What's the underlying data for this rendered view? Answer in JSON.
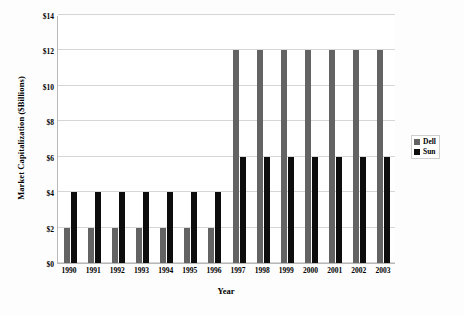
{
  "chart_data": {
    "type": "bar",
    "title": "",
    "xlabel": "Year",
    "ylabel": "Market Capitalization ($Billions)",
    "categories": [
      "1990",
      "1991",
      "1992",
      "1993",
      "1994",
      "1995",
      "1996",
      "1997",
      "1998",
      "1999",
      "2000",
      "2001",
      "2002",
      "2003"
    ],
    "series": [
      {
        "name": "Dell",
        "color": "#636363",
        "values": [
          2,
          2,
          2,
          2,
          2,
          2,
          2,
          12,
          12,
          12,
          12,
          12,
          12,
          12
        ]
      },
      {
        "name": "Sun",
        "color": "#0d0d0d",
        "values": [
          4,
          4,
          4,
          4,
          4,
          4,
          4,
          6,
          6,
          6,
          6,
          6,
          6,
          6
        ]
      }
    ],
    "ylim": [
      0,
      14
    ],
    "yticks": [
      0,
      2,
      4,
      6,
      8,
      10,
      12,
      14
    ],
    "ytick_labels": [
      "$0",
      "$2",
      "$4",
      "$6",
      "$8",
      "$10",
      "$12",
      "$14"
    ],
    "grid": true,
    "legend_position": "right-middle"
  },
  "legend": {
    "items": [
      {
        "label": "Dell",
        "swatch": "dell"
      },
      {
        "label": "Sun",
        "swatch": "sun"
      }
    ]
  },
  "axes": {
    "x_title": "Year",
    "y_title": "Market Capitalization ($Billions)"
  }
}
